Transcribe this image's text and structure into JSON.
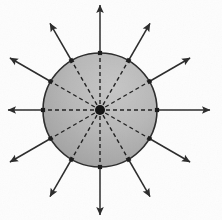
{
  "figure": {
    "name": "radial-field-diagram",
    "title": "Radial field lines emanating from a point charge inside a uniform sphere",
    "canvas": {
      "width": 222,
      "height": 220
    },
    "background_color": "#fdfdfd"
  },
  "chart_data": {
    "type": "scatter",
    "title": "Radial field lines emanating from a point charge inside a uniform sphere",
    "xlabel": "",
    "ylabel": "",
    "grid": false,
    "legend_position": "none",
    "xlim": [
      0,
      222
    ],
    "ylim": [
      0,
      220
    ],
    "center": {
      "x": 100,
      "y": 110,
      "label": "source-point"
    },
    "circle": {
      "cx": 100,
      "cy": 110,
      "r": 57,
      "fill_light": "#bdbdbd",
      "fill_dark": "#9a9a9a",
      "stroke": "#2b2b2b",
      "stroke_width": 1.6
    },
    "ray_count": 12,
    "ray_angle_step_deg": 30,
    "inner_style": "dashed",
    "outer_style": "solid-arrow",
    "series": [
      {
        "name": "angle_deg",
        "values": [
          0,
          30,
          60,
          90,
          120,
          150,
          180,
          210,
          240,
          270,
          300,
          330
        ]
      },
      {
        "name": "inner_r_start",
        "values": [
          0,
          0,
          0,
          0,
          0,
          0,
          0,
          0,
          0,
          0,
          0,
          0
        ]
      },
      {
        "name": "inner_r_end",
        "values": [
          57,
          57,
          57,
          57,
          57,
          57,
          57,
          57,
          57,
          57,
          57,
          57
        ]
      },
      {
        "name": "outer_r_end",
        "values": [
          110,
          104,
          100,
          105,
          100,
          104,
          92,
          104,
          100,
          105,
          100,
          104
        ]
      }
    ],
    "boundary_markers": {
      "shape": "square",
      "size": 4.2,
      "color": "#1a1a1a",
      "radius_from_center": 57
    },
    "center_marker": {
      "shape": "circle",
      "radius": 5,
      "color": "#111111"
    },
    "arrow": {
      "head_length": 9,
      "head_width": 5.5,
      "stroke": "#2a2a2a",
      "stroke_width": 1.5
    },
    "dash_pattern": "4 3",
    "dash_stroke": "#1f1f1f",
    "dash_stroke_width": 1.4
  },
  "colors": {
    "background": "#fdfdfd",
    "sphere_fill_light": "#bdbdbd",
    "sphere_fill_dark": "#9a9a9a",
    "sphere_outline": "#2b2b2b",
    "line": "#2a2a2a",
    "marker": "#111111"
  }
}
